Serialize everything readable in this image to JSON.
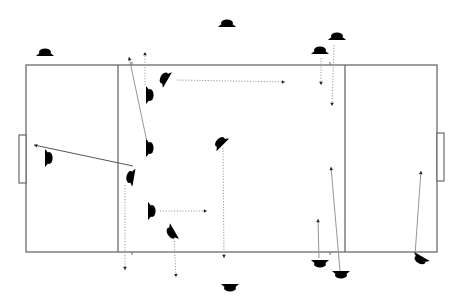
{
  "diagram": {
    "title": "",
    "type": "tactical-field-diagram",
    "colors": {
      "field_line": "#6b6b6b",
      "team_light": "#ffffff",
      "team_dark": "#111111",
      "movement": "#9a9a9a",
      "arrowhead": "#222222"
    },
    "field": {
      "x": 26,
      "y": 65,
      "width": 411,
      "height": 187,
      "zone_lines_x": [
        118,
        345
      ],
      "goals": [
        {
          "side": "left",
          "x": 19,
          "y": 135,
          "width": 7,
          "height": 48
        },
        {
          "side": "right",
          "x": 437,
          "y": 133,
          "width": 7,
          "height": 48
        }
      ],
      "ticks": [
        {
          "x": 132,
          "y": 65,
          "dir": "up"
        },
        {
          "x": 330,
          "y": 65,
          "dir": "up"
        },
        {
          "x": 132,
          "y": 252,
          "dir": "down"
        },
        {
          "x": 330,
          "y": 252,
          "dir": "down"
        }
      ]
    },
    "players": [
      {
        "id": "p1",
        "team": "light",
        "x": 45,
        "y": 52,
        "rot": 0
      },
      {
        "id": "p2",
        "team": "light",
        "x": 227,
        "y": 23,
        "rot": 0
      },
      {
        "id": "p3",
        "team": "light",
        "x": 337,
        "y": 36,
        "rot": 0
      },
      {
        "id": "p4",
        "team": "light",
        "x": 320,
        "y": 50,
        "rot": 0
      },
      {
        "id": "p5",
        "team": "light",
        "x": 150,
        "y": 95,
        "rot": 90
      },
      {
        "id": "p6",
        "team": "light",
        "x": 150,
        "y": 148,
        "rot": 90
      },
      {
        "id": "p7",
        "team": "light",
        "x": 49,
        "y": 158,
        "rot": 90
      },
      {
        "id": "p8",
        "team": "light",
        "x": 152,
        "y": 211,
        "rot": 90
      },
      {
        "id": "d1",
        "team": "dark",
        "x": 164,
        "y": 78,
        "rot": -60
      },
      {
        "id": "d2",
        "team": "dark",
        "x": 220,
        "y": 142,
        "rot": -45
      },
      {
        "id": "d3",
        "team": "dark",
        "x": 130,
        "y": 177,
        "rot": -80
      },
      {
        "id": "d4",
        "team": "dark",
        "x": 171,
        "y": 233,
        "rot": 240
      },
      {
        "id": "d5",
        "team": "dark",
        "x": 230,
        "y": 288,
        "rot": 180
      },
      {
        "id": "d6",
        "team": "dark",
        "x": 320,
        "y": 264,
        "rot": 180
      },
      {
        "id": "d7",
        "team": "dark",
        "x": 341,
        "y": 275,
        "rot": 180
      },
      {
        "id": "d8",
        "team": "dark",
        "x": 420,
        "y": 260,
        "rot": 210
      }
    ],
    "movements": [
      {
        "style": "dotted",
        "x1": 177,
        "y1": 80,
        "x2": 285,
        "y2": 82
      },
      {
        "style": "dotted",
        "x1": 145,
        "y1": 85,
        "x2": 145,
        "y2": 52
      },
      {
        "style": "solid",
        "x1": 147,
        "y1": 142,
        "x2": 129,
        "y2": 57
      },
      {
        "style": "solid-dark",
        "x1": 133,
        "y1": 166,
        "x2": 34,
        "y2": 145
      },
      {
        "style": "dotted",
        "x1": 125,
        "y1": 185,
        "x2": 125,
        "y2": 270
      },
      {
        "style": "dotted",
        "x1": 160,
        "y1": 211,
        "x2": 207,
        "y2": 211
      },
      {
        "style": "dotted",
        "x1": 174,
        "y1": 238,
        "x2": 176,
        "y2": 277
      },
      {
        "style": "dotted",
        "x1": 223,
        "y1": 148,
        "x2": 224,
        "y2": 258
      },
      {
        "style": "dotted",
        "x1": 321,
        "y1": 58,
        "x2": 321,
        "y2": 85
      },
      {
        "style": "dotted",
        "x1": 334,
        "y1": 45,
        "x2": 332,
        "y2": 106
      },
      {
        "style": "solid",
        "x1": 319,
        "y1": 258,
        "x2": 318,
        "y2": 219
      },
      {
        "style": "solid",
        "x1": 340,
        "y1": 271,
        "x2": 331,
        "y2": 167
      },
      {
        "style": "solid",
        "x1": 415,
        "y1": 255,
        "x2": 421,
        "y2": 171
      }
    ]
  }
}
